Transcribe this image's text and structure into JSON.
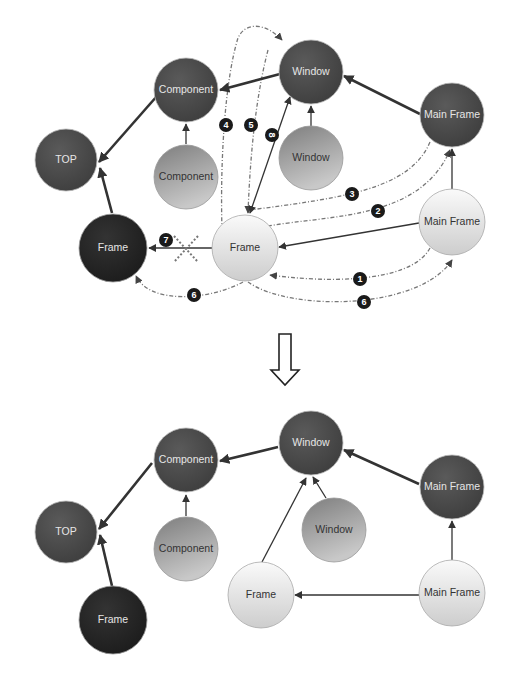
{
  "colors": {
    "dark_node": "#4a4a4a",
    "black_node": "#262626",
    "mid_node_top": "#8a8a8a",
    "mid_node_bottom": "#c4c4c4",
    "light_node_top": "#f4f4f4",
    "light_node_bottom": "#cfcfcf",
    "edge": "#333333",
    "dashed_edge": "#666666",
    "badge": "#1a1a1a",
    "cross": "#777777"
  },
  "before": {
    "nodes": {
      "component_parent": {
        "label": "Component"
      },
      "window_parent": {
        "label": "Window"
      },
      "mainframe_parent": {
        "label": "Main Frame"
      },
      "top": {
        "label": "TOP"
      },
      "component_child": {
        "label": "Component"
      },
      "window_child": {
        "label": "Window"
      },
      "frame_dark": {
        "label": "Frame"
      },
      "frame_light": {
        "label": "Frame"
      },
      "mainframe_light": {
        "label": "Main Frame"
      }
    },
    "steps": {
      "s1": "1",
      "s2": "2",
      "s3": "3",
      "s4": "4",
      "s5": "5",
      "s6a": "6",
      "s6b": "6",
      "s7": "7",
      "s8": "8"
    }
  },
  "transition_arrow": {
    "icon": "hollow-down-arrow"
  },
  "after": {
    "nodes": {
      "window_parent": {
        "label": "Window"
      },
      "component_parent": {
        "label": "Component"
      },
      "mainframe_parent": {
        "label": "Main Frame"
      },
      "top": {
        "label": "TOP"
      },
      "component_child": {
        "label": "Component"
      },
      "window_child": {
        "label": "Window"
      },
      "frame_dark": {
        "label": "Frame"
      },
      "frame_light": {
        "label": "Frame"
      },
      "mainframe_light": {
        "label": "Main Frame"
      }
    }
  }
}
